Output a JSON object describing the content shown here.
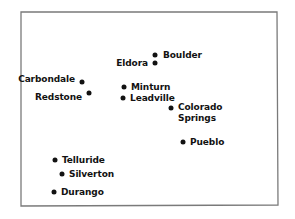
{
  "style": {
    "background_color": "#ffffff",
    "border_color": "#7a7a7a",
    "marker_color": "#121212",
    "label_color": "#121212"
  },
  "border": {
    "name": "colorado-state-outline",
    "shape": "quadrilateral",
    "corners": {
      "top_left": [
        21,
        12
      ],
      "top_right": [
        277,
        12
      ],
      "bottom_right": [
        278,
        205
      ],
      "bottom_left": [
        21,
        206
      ]
    }
  },
  "chart_data": {
    "type": "scatter",
    "xlabel": "",
    "ylabel": "",
    "xlim": [
      0,
      295
    ],
    "ylim": [
      0,
      219
    ],
    "grid": false,
    "legend": "none",
    "points": [
      {
        "label": "Boulder",
        "dot": [
          155,
          55
        ],
        "label_pos": [
          163,
          55
        ],
        "anchor": "left",
        "lines": [
          "Boulder"
        ]
      },
      {
        "label": "Eldora",
        "dot": [
          155,
          63
        ],
        "label_pos": [
          148,
          63
        ],
        "anchor": "right",
        "lines": [
          "Eldora"
        ]
      },
      {
        "label": "Carbondale",
        "dot": [
          82,
          82
        ],
        "label_pos": [
          75,
          79
        ],
        "anchor": "right",
        "lines": [
          "Carbondale"
        ]
      },
      {
        "label": "Redstone",
        "dot": [
          89,
          93
        ],
        "label_pos": [
          82,
          97
        ],
        "anchor": "right",
        "lines": [
          "Redstone"
        ]
      },
      {
        "label": "Minturn",
        "dot": [
          124,
          87
        ],
        "label_pos": [
          131,
          87
        ],
        "anchor": "left",
        "lines": [
          "Minturn"
        ]
      },
      {
        "label": "Leadville",
        "dot": [
          123,
          98
        ],
        "label_pos": [
          130,
          98
        ],
        "anchor": "left",
        "lines": [
          "Leadville"
        ]
      },
      {
        "label": "Colorado Springs",
        "dot": [
          171,
          108
        ],
        "label_pos": [
          178,
          113
        ],
        "anchor": "left",
        "lines": [
          "Colorado",
          "Springs"
        ]
      },
      {
        "label": "Pueblo",
        "dot": [
          183,
          142
        ],
        "label_pos": [
          190,
          142
        ],
        "anchor": "left",
        "lines": [
          "Pueblo"
        ]
      },
      {
        "label": "Telluride",
        "dot": [
          55,
          160
        ],
        "label_pos": [
          62,
          160
        ],
        "anchor": "left",
        "lines": [
          "Telluride"
        ]
      },
      {
        "label": "Silverton",
        "dot": [
          62,
          174
        ],
        "label_pos": [
          69,
          174
        ],
        "anchor": "left",
        "lines": [
          "Silverton"
        ]
      },
      {
        "label": "Durango",
        "dot": [
          54,
          192
        ],
        "label_pos": [
          61,
          192
        ],
        "anchor": "left",
        "lines": [
          "Durango"
        ]
      }
    ]
  }
}
